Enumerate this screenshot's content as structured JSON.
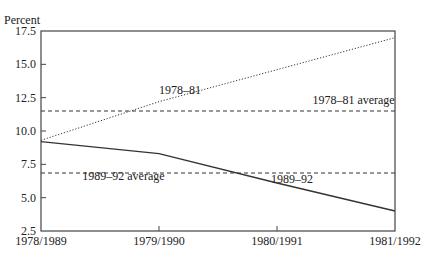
{
  "chart_data": {
    "type": "line",
    "title": "",
    "ylabel": "Percent",
    "xlabel": "",
    "categories": [
      "1978/1989",
      "1979/1990",
      "1980/1991",
      "1981/1992"
    ],
    "yticks": [
      "17.5",
      "15.0",
      "12.5",
      "10.0",
      "7.5",
      "5.0",
      "2.5"
    ],
    "ylim": [
      2.5,
      17.5
    ],
    "grid": false,
    "series": [
      {
        "name": "1978–81",
        "style": "dotted",
        "values": [
          9.3,
          12.2,
          14.6,
          17.0
        ]
      },
      {
        "name": "1989–92",
        "style": "solid",
        "values": [
          9.2,
          8.3,
          6.1,
          4.0
        ]
      },
      {
        "name": "1978–81 average",
        "style": "dashed",
        "values": [
          11.5,
          11.5,
          11.5,
          11.5
        ]
      },
      {
        "name": "1989–92 average",
        "style": "dashed",
        "values": [
          6.85,
          6.85,
          6.85,
          6.85
        ]
      }
    ],
    "annotations": [
      {
        "text": "1978–81",
        "x": 1.0,
        "y": 12.8
      },
      {
        "text": "1978–81 average",
        "x": 2.3,
        "y": 12.0
      },
      {
        "text": "1989–92 average",
        "x": 0.35,
        "y": 6.3
      },
      {
        "text": "1989–92",
        "x": 1.95,
        "y": 6.1
      }
    ]
  }
}
